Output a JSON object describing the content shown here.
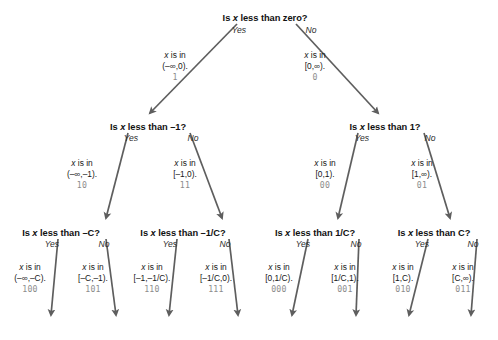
{
  "diagram": {
    "title_semantics": "binary-decision-tree-for-interval-classification",
    "colors": {
      "background": "#ffffff",
      "node_text": "#111111",
      "edge_arrow": "#5e5e5e",
      "code_label": "#8c8c8c",
      "label_text": "#161616"
    },
    "nodes": [
      {
        "id": "root",
        "text_pre": "Is ",
        "var": "x",
        "text_post": " less than zero?",
        "x": 265,
        "y": 13
      },
      {
        "id": "n_l",
        "text_pre": "Is ",
        "var": "x",
        "text_post": " less than –1?",
        "x": 148,
        "y": 122
      },
      {
        "id": "n_r",
        "text_pre": "Is ",
        "var": "x",
        "text_post": " less than 1?",
        "x": 385,
        "y": 122
      },
      {
        "id": "n_ll",
        "text_pre": "Is ",
        "var": "x",
        "text_post": " less than –C?",
        "x": 61,
        "y": 228
      },
      {
        "id": "n_lr",
        "text_pre": "Is ",
        "var": "x",
        "text_post": " less than –1/C?",
        "x": 183,
        "y": 228
      },
      {
        "id": "n_rl",
        "text_pre": "Is ",
        "var": "x",
        "text_post": " less than 1/C?",
        "x": 315,
        "y": 228
      },
      {
        "id": "n_rr",
        "text_pre": "Is ",
        "var": "x",
        "text_post": " less than C?",
        "x": 434,
        "y": 228
      }
    ],
    "branch_labels": [
      {
        "id": "root-yes",
        "text": "Yes",
        "x": 239,
        "y": 25
      },
      {
        "id": "root-no",
        "text": "No",
        "x": 311,
        "y": 25
      },
      {
        "id": "nl-yes",
        "text": "Yes",
        "x": 131,
        "y": 133
      },
      {
        "id": "nl-no",
        "text": "No",
        "x": 193,
        "y": 133
      },
      {
        "id": "nr-yes",
        "text": "Yes",
        "x": 362,
        "y": 133
      },
      {
        "id": "nr-no",
        "text": "No",
        "x": 430,
        "y": 133
      },
      {
        "id": "nll-yes",
        "text": "Yes",
        "x": 52,
        "y": 239
      },
      {
        "id": "nll-no",
        "text": "No",
        "x": 104,
        "y": 239
      },
      {
        "id": "nlr-yes",
        "text": "Yes",
        "x": 170,
        "y": 239
      },
      {
        "id": "nlr-no",
        "text": "No",
        "x": 225,
        "y": 239
      },
      {
        "id": "nrl-yes",
        "text": "Yes",
        "x": 303,
        "y": 239
      },
      {
        "id": "nrl-no",
        "text": "No",
        "x": 356,
        "y": 239
      },
      {
        "id": "nrr-yes",
        "text": "Yes",
        "x": 422,
        "y": 239
      },
      {
        "id": "nrr-no",
        "text": "No",
        "x": 473,
        "y": 239
      }
    ],
    "edge_labels": [
      {
        "id": "e-root-yes",
        "line1_pre": "x",
        "line1_post": " is in",
        "line2": "(–∞,0).",
        "code": "1",
        "x": 175,
        "y": 50
      },
      {
        "id": "e-root-no",
        "line1_pre": "x",
        "line1_post": " is in",
        "line2": "[0,∞).",
        "code": "0",
        "x": 315,
        "y": 50
      },
      {
        "id": "e-nl-yes",
        "line1_pre": "x",
        "line1_post": " is in",
        "line2": "(–∞,–1).",
        "code": "10",
        "x": 82,
        "y": 158
      },
      {
        "id": "e-nl-no",
        "line1_pre": "x",
        "line1_post": " is in",
        "line2": "[–1,0).",
        "code": "11",
        "x": 185,
        "y": 158
      },
      {
        "id": "e-nr-yes",
        "line1_pre": "x",
        "line1_post": " is in",
        "line2": "[0,1).",
        "code": "00",
        "x": 325,
        "y": 158
      },
      {
        "id": "e-nr-no",
        "line1_pre": "x",
        "line1_post": " is in",
        "line2": "[1,∞).",
        "code": "01",
        "x": 422,
        "y": 158
      },
      {
        "id": "e-nll-yes",
        "line1_pre": "x",
        "line1_post": " is in",
        "line2": "(–∞,–C).",
        "code": "100",
        "x": 30,
        "y": 262
      },
      {
        "id": "e-nll-no",
        "line1_pre": "x",
        "line1_post": " is in",
        "line2": "[–C,–1).",
        "code": "101",
        "x": 93,
        "y": 262
      },
      {
        "id": "e-nlr-yes",
        "line1_pre": "x",
        "line1_post": " is in",
        "line2": "[–1,–1/C).",
        "code": "110",
        "x": 152,
        "y": 262
      },
      {
        "id": "e-nlr-no",
        "line1_pre": "x",
        "line1_post": " is in",
        "line2": "[–1/C,0).",
        "code": "111",
        "x": 216,
        "y": 262
      },
      {
        "id": "e-nrl-yes",
        "line1_pre": "x",
        "line1_post": " is in",
        "line2": "[0,1/C).",
        "code": "000",
        "x": 279,
        "y": 262
      },
      {
        "id": "e-nrl-no",
        "line1_pre": "x",
        "line1_post": " is in",
        "line2": "[1/C,1).",
        "code": "001",
        "x": 345,
        "y": 262
      },
      {
        "id": "e-nrr-yes",
        "line1_pre": "x",
        "line1_post": " is in",
        "line2": "[1,C).",
        "code": "010",
        "x": 403,
        "y": 262
      },
      {
        "id": "e-nrr-no",
        "line1_pre": "x",
        "line1_post": " is in",
        "line2": "[C,∞).",
        "code": "011",
        "x": 463,
        "y": 262
      }
    ],
    "edges": [
      {
        "id": "edge-root-yes",
        "x1": 237,
        "y1": 24,
        "x2": 150,
        "y2": 113
      },
      {
        "id": "edge-root-no",
        "x1": 296,
        "y1": 24,
        "x2": 378,
        "y2": 113
      },
      {
        "id": "edge-nl-yes",
        "x1": 128,
        "y1": 133,
        "x2": 106,
        "y2": 218
      },
      {
        "id": "edge-nl-no",
        "x1": 190,
        "y1": 133,
        "x2": 222,
        "y2": 218
      },
      {
        "id": "edge-nr-yes",
        "x1": 358,
        "y1": 133,
        "x2": 338,
        "y2": 218
      },
      {
        "id": "edge-nr-no",
        "x1": 424,
        "y1": 133,
        "x2": 450,
        "y2": 218
      },
      {
        "id": "edge-nll-yes",
        "x1": 58,
        "y1": 239,
        "x2": 51,
        "y2": 315
      },
      {
        "id": "edge-nll-no",
        "x1": 106,
        "y1": 239,
        "x2": 116,
        "y2": 315
      },
      {
        "id": "edge-nlr-yes",
        "x1": 177,
        "y1": 239,
        "x2": 169,
        "y2": 315
      },
      {
        "id": "edge-nlr-no",
        "x1": 229,
        "y1": 239,
        "x2": 238,
        "y2": 315
      },
      {
        "id": "edge-nrl-yes",
        "x1": 308,
        "y1": 239,
        "x2": 292,
        "y2": 315
      },
      {
        "id": "edge-nrl-no",
        "x1": 359,
        "y1": 239,
        "x2": 356,
        "y2": 315
      },
      {
        "id": "edge-nrr-yes",
        "x1": 428,
        "y1": 239,
        "x2": 409,
        "y2": 315
      },
      {
        "id": "edge-nrr-no",
        "x1": 477,
        "y1": 239,
        "x2": 471,
        "y2": 315
      }
    ]
  }
}
